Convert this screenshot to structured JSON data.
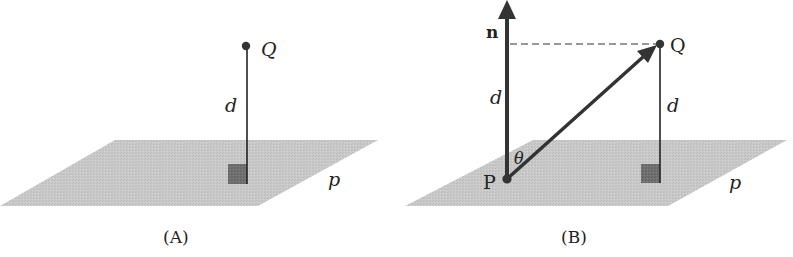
{
  "colors": {
    "plane": "#c8c8c8",
    "right_angle_marker": "#6e6e6e",
    "ink": "#222222",
    "background": "#ffffff"
  },
  "panel_a": {
    "caption": "(A)",
    "point_label": "Q",
    "distance_label": "d",
    "plane_label": "p"
  },
  "panel_b": {
    "caption": "(B)",
    "normal_label": "n",
    "point_q_label": "Q",
    "point_p_label": "P",
    "distance_label_left": "d",
    "distance_label_right": "d",
    "angle_label": "θ",
    "plane_label": "p"
  }
}
